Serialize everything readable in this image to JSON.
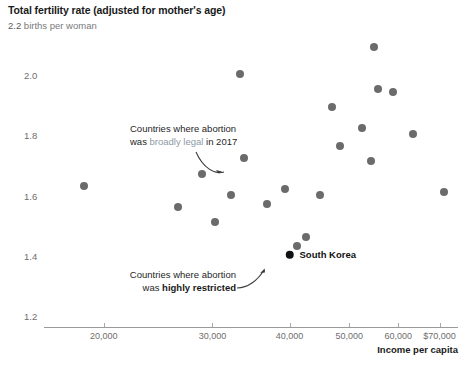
{
  "chart_data": {
    "type": "scatter",
    "title": "Total fertility rate (adjusted for mother's age)",
    "subtitle_value": "2.2",
    "subtitle_unit": "births per woman",
    "xlabel": "Income per capita",
    "ylabel": "",
    "xscale": "log",
    "xlim": [
      16000,
      75000
    ],
    "ylim": [
      1.2,
      2.2
    ],
    "grid": false,
    "legend_position": "none",
    "xticks": [
      {
        "value": 20000,
        "label": "20,000"
      },
      {
        "value": 30000,
        "label": "30,000"
      },
      {
        "value": 40000,
        "label": "40,000"
      },
      {
        "value": 50000,
        "label": "50,000"
      },
      {
        "value": 60000,
        "label": "60,000"
      },
      {
        "value": 70000,
        "label": "$70,000"
      }
    ],
    "yticks": [
      {
        "value": 2.0,
        "label": "2.0"
      },
      {
        "value": 1.8,
        "label": "1.8"
      },
      {
        "value": 1.6,
        "label": "1.6"
      },
      {
        "value": 1.4,
        "label": "1.4"
      },
      {
        "value": 1.2,
        "label": "1.2"
      }
    ],
    "series": [
      {
        "name": "Countries where abortion was broadly legal in 2017",
        "color": "#6b6b6b",
        "points": [
          {
            "x": 18600,
            "y": 1.64
          },
          {
            "x": 26400,
            "y": 1.57
          },
          {
            "x": 28900,
            "y": 1.68
          },
          {
            "x": 30300,
            "y": 1.52
          },
          {
            "x": 32200,
            "y": 1.61
          },
          {
            "x": 33300,
            "y": 2.01
          },
          {
            "x": 33800,
            "y": 1.73
          },
          {
            "x": 36800,
            "y": 1.58
          },
          {
            "x": 39400,
            "y": 1.63
          },
          {
            "x": 41200,
            "y": 1.44
          },
          {
            "x": 42600,
            "y": 1.47
          },
          {
            "x": 44800,
            "y": 1.61
          },
          {
            "x": 46800,
            "y": 1.9
          },
          {
            "x": 48300,
            "y": 1.77
          },
          {
            "x": 52500,
            "y": 1.83
          },
          {
            "x": 54200,
            "y": 1.72
          },
          {
            "x": 54900,
            "y": 2.1
          },
          {
            "x": 55600,
            "y": 1.96
          },
          {
            "x": 58900,
            "y": 1.95
          },
          {
            "x": 63500,
            "y": 1.81
          },
          {
            "x": 71200,
            "y": 1.62
          }
        ]
      },
      {
        "name": "Countries where abortion was highly restricted",
        "color": "#111111",
        "points": [
          {
            "x": 40000,
            "y": 1.41,
            "label": "South Korea"
          }
        ]
      }
    ],
    "annotations": [
      {
        "id": "legal-annotation",
        "line1_prefix": "Countries where abortion",
        "line2_prefix": "was ",
        "line2_emph": "broadly legal",
        "line2_suffix": " in 2017"
      },
      {
        "id": "restricted-annotation",
        "line1": "Countries where abortion",
        "line2_prefix": "was ",
        "line2_emph": "highly restricted"
      }
    ]
  }
}
